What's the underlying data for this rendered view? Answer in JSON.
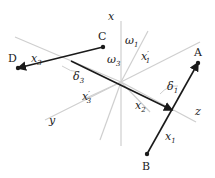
{
  "diagram": {
    "origin": {
      "x": 121,
      "y": 82
    },
    "axes": [
      {
        "id": "x",
        "label": "x",
        "x1": 121,
        "y1": 82,
        "x2": 121,
        "y2": 21,
        "label_x": 108,
        "label_y": 20
      },
      {
        "id": "x-down",
        "label": "",
        "x1": 121,
        "y1": 82,
        "x2": 121,
        "y2": 146
      },
      {
        "id": "y",
        "label": "y",
        "x1": 121,
        "y1": 82,
        "x2": 45,
        "y2": 120,
        "label_x": 49,
        "label_y": 124
      },
      {
        "id": "z",
        "label": "z",
        "x1": 121,
        "y1": 82,
        "x2": 196,
        "y2": 122,
        "label_x": 195,
        "label_y": 115
      },
      {
        "id": "upper-left",
        "label": "",
        "x1": 121,
        "y1": 82,
        "x2": 15,
        "y2": 37
      },
      {
        "id": "upper-right",
        "label": "",
        "x1": 121,
        "y1": 82,
        "x2": 200,
        "y2": 42
      },
      {
        "id": "x1-prime",
        "label": "x'1",
        "x1": 121,
        "y1": 82,
        "x2": 148,
        "y2": 31
      },
      {
        "id": "x3-prime",
        "label": "x'3",
        "x1": 121,
        "y1": 82,
        "x2": 82,
        "y2": 100
      },
      {
        "id": "lower-left-diag",
        "label": "",
        "x1": 121,
        "y1": 82,
        "x2": 100,
        "y2": 140
      },
      {
        "id": "lower-right-diag",
        "label": "",
        "x1": 121,
        "y1": 82,
        "x2": 150,
        "y2": 112
      }
    ],
    "points": [
      {
        "name": "A",
        "x": 198,
        "y": 63,
        "label_x": 194,
        "label_y": 56
      },
      {
        "name": "B",
        "x": 147,
        "y": 154,
        "label_x": 142,
        "label_y": 170
      },
      {
        "name": "C",
        "x": 103,
        "y": 47,
        "label_x": 98,
        "label_y": 40
      },
      {
        "name": "D",
        "x": 18,
        "y": 68,
        "label_x": 8,
        "label_y": 62
      }
    ],
    "segments": [
      {
        "name": "x1",
        "from": "B",
        "to": "A",
        "arrow": "A"
      },
      {
        "name": "x3",
        "from": "C",
        "to": "D",
        "arrow": "D"
      },
      {
        "name": "x2",
        "x1": 71,
        "y1": 61,
        "x2": 172,
        "y2": 110,
        "arrow": "end"
      }
    ],
    "labels": [
      {
        "text": "x",
        "sub": "3",
        "prime": false,
        "x": 31,
        "y": 62
      },
      {
        "text": "x",
        "sub": "2",
        "prime": false,
        "x": 135,
        "y": 109
      },
      {
        "text": "x",
        "sub": "1",
        "prime": false,
        "x": 165,
        "y": 140
      },
      {
        "text": "x",
        "sub": "1",
        "prime": true,
        "x": 141,
        "y": 60
      },
      {
        "text": "x",
        "sub": "3",
        "prime": true,
        "x": 82,
        "y": 100
      },
      {
        "text": "ω",
        "sub": "1",
        "prime": false,
        "x": 125,
        "y": 44
      },
      {
        "text": "ω",
        "sub": "3",
        "prime": false,
        "x": 107,
        "y": 63
      },
      {
        "text": "δ",
        "sub": "1",
        "prime": false,
        "x": 167,
        "y": 90
      },
      {
        "text": "δ",
        "sub": "3",
        "prime": false,
        "x": 73,
        "y": 80
      }
    ],
    "colors": {
      "line": "#1a1a1a",
      "axis": "#c8c8c8",
      "text": "#222222"
    }
  }
}
